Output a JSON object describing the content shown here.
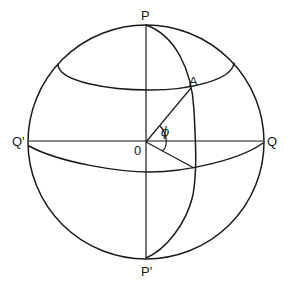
{
  "diagram": {
    "labels": {
      "north_pole": "P",
      "south_pole": "P'",
      "equator_left": "Q'",
      "equator_right": "Q",
      "center": "0",
      "point": "A",
      "angle": "ϕ"
    },
    "colors": {
      "stroke": "#1a1a1a",
      "background": "#ffffff"
    }
  }
}
